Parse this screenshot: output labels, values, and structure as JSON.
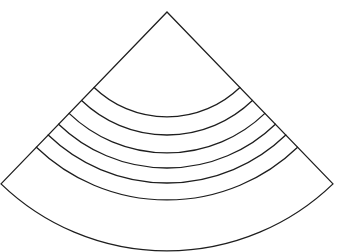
{
  "diagram": {
    "type": "circular-sector-with-concentric-arcs",
    "stroke_color": "#1e1e1e",
    "background": "#ffffff",
    "apex": [
      167,
      12
    ],
    "half_angle_deg": 44,
    "outer_radius": 239,
    "inner_arc_radii": [
      105,
      123,
      141,
      156,
      171,
      188
    ],
    "inner_arc_count": 6
  }
}
